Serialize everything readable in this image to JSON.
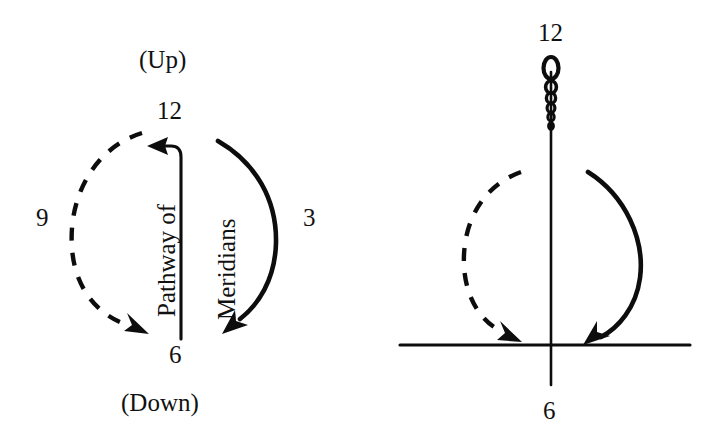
{
  "figure": {
    "title_visible": false,
    "background_color": "#ffffff",
    "ink_color": "#0d0d0d",
    "panels": [
      {
        "name": "left-clock-diagram",
        "labels": {
          "top_direction": "(Up)",
          "top_hour": "12",
          "left_hour": "9",
          "right_hour": "3",
          "bottom_hour": "6",
          "bottom_direction": "(Down)",
          "vertical_left": "Pathway of",
          "vertical_right": "Meridians"
        },
        "arcs": [
          {
            "name": "left-dashed-descending-arc",
            "style": "dashed",
            "direction": "downward",
            "side": "left"
          },
          {
            "name": "right-solid-descending-arc",
            "style": "solid",
            "direction": "downward",
            "side": "right"
          }
        ],
        "axis": {
          "name": "center-vertical-axis-with-hook",
          "orientation": "vertical",
          "hook_arrow": "left"
        }
      },
      {
        "name": "right-needle-diagram",
        "labels": {
          "top_hour": "12",
          "bottom_hour": "6"
        },
        "arcs": [
          {
            "name": "left-dashed-descending-arc",
            "style": "dashed",
            "direction": "downward",
            "side": "left"
          },
          {
            "name": "right-solid-descending-arc",
            "style": "solid",
            "direction": "downward",
            "side": "right"
          }
        ],
        "axis": {
          "name": "vertical-needle-axis",
          "orientation": "vertical"
        },
        "ground": {
          "name": "horizontal-baseline",
          "orientation": "horizontal"
        },
        "coil": {
          "name": "tapering-coil-spiral",
          "loops": 6,
          "largest_at": "top"
        }
      }
    ]
  }
}
